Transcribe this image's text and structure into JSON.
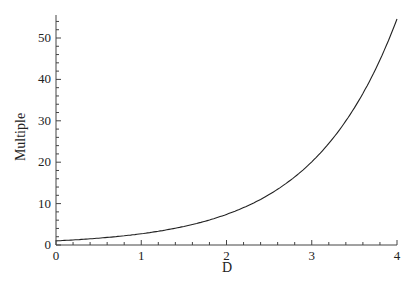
{
  "chart_data": {
    "type": "line",
    "title": "",
    "xlabel": "D",
    "ylabel": "Multiple",
    "xlim": [
      0,
      4
    ],
    "ylim": [
      0,
      55.5
    ],
    "grid": false,
    "legend": null,
    "x_ticks": [
      0,
      1,
      2,
      3,
      4
    ],
    "y_ticks": [
      0,
      10,
      20,
      30,
      40,
      50
    ],
    "series": [
      {
        "name": "Multiple = e^D",
        "color": "#222222",
        "x": [
          0,
          0.25,
          0.5,
          0.75,
          1,
          1.25,
          1.5,
          1.75,
          2,
          2.25,
          2.5,
          2.75,
          3,
          3.25,
          3.5,
          3.75,
          4
        ],
        "values": [
          1.0,
          1.28,
          1.65,
          2.12,
          2.72,
          3.49,
          4.48,
          5.75,
          7.39,
          9.49,
          12.18,
          15.64,
          20.09,
          25.79,
          33.12,
          42.52,
          54.6
        ]
      }
    ]
  }
}
